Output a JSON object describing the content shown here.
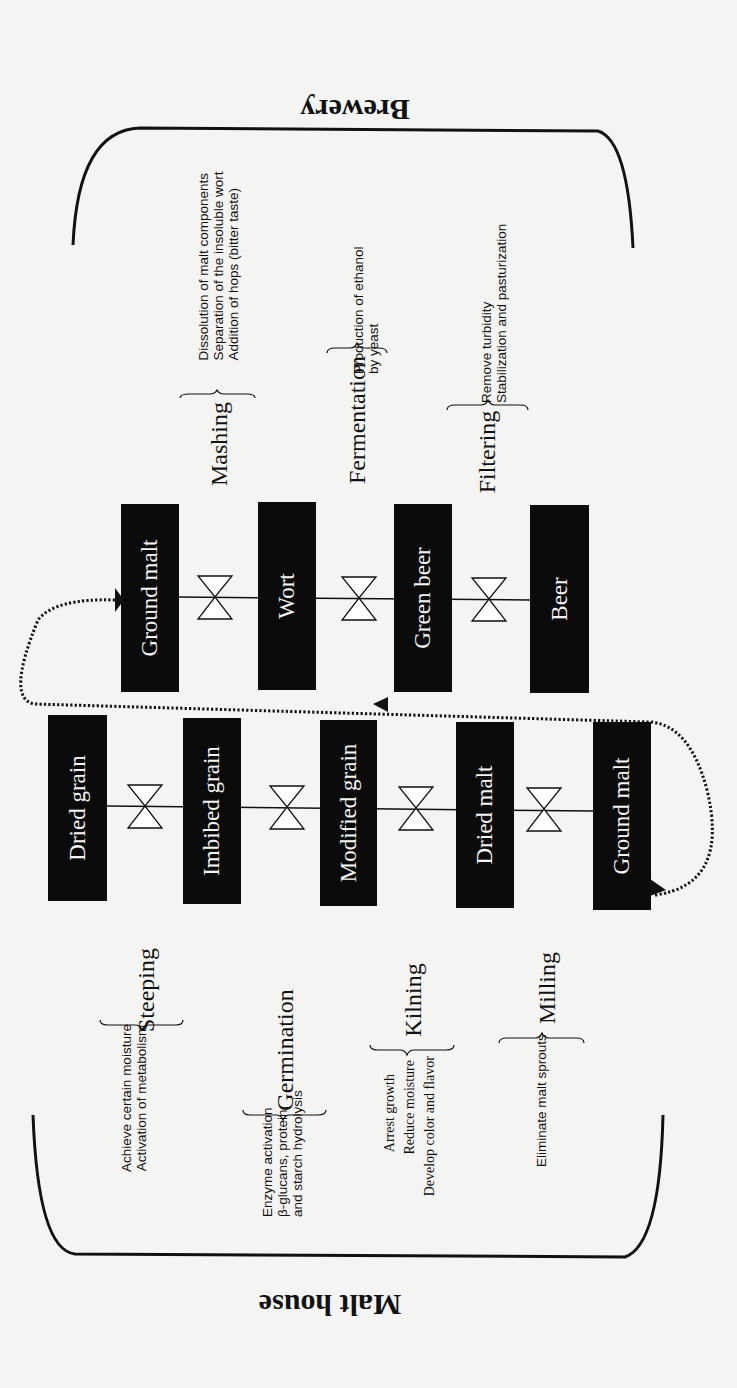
{
  "sections": {
    "brewery_title": "Brewery",
    "malt_house_title": "Malt house"
  },
  "brewery": {
    "boxes": [
      "Ground malt",
      "Wort",
      "Green beer",
      "Beer"
    ],
    "processes": [
      {
        "label": "Mashing",
        "details": [
          "Dissolution of malt components",
          "Separation of the insoluble wort",
          "Addition of hops (bitter taste)"
        ]
      },
      {
        "label": "Fermentation",
        "details": [
          "Production of ethanol",
          "by yeast"
        ]
      },
      {
        "label": "Filtering",
        "details": [
          "Remove turbidity",
          "Stabilization and pasturization"
        ]
      }
    ]
  },
  "malt_house": {
    "boxes": [
      "Dried grain",
      "Imbibed grain",
      "Modified grain",
      "Dried malt",
      "Ground malt"
    ],
    "processes": [
      {
        "label": "Steeping",
        "details": [
          "Achieve certain moisture",
          "Activation of metabolism"
        ]
      },
      {
        "label": "Germination",
        "details": [
          "Enzyme activation",
          "β-glucans, protein,",
          "and starch hydrolysis"
        ]
      },
      {
        "label": "Kilning",
        "details": [
          "Arrest growth",
          "Reduce moisture",
          "Develop color and flavor"
        ]
      },
      {
        "label": "Milling",
        "details": [
          "Eliminate malt sprouts"
        ]
      }
    ]
  },
  "colors": {
    "background": "#f4f4f2",
    "box_fill": "#0b0b0b",
    "box_text": "#f4f4f2",
    "line": "#111111"
  }
}
